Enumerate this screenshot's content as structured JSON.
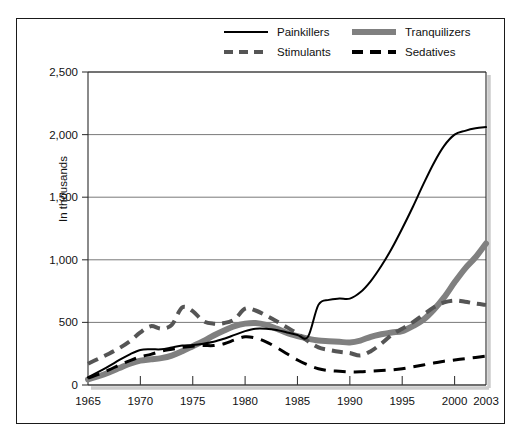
{
  "chart_data": {
    "type": "line",
    "title": "",
    "xlabel": "",
    "ylabel": "In thousands",
    "xlim": [
      1965,
      2003
    ],
    "ylim": [
      0,
      2500
    ],
    "grid": true,
    "legend_position": "top",
    "x_ticks": [
      "1965",
      "1970",
      "1975",
      "1980",
      "1985",
      "1990",
      "1995",
      "2000",
      "2003"
    ],
    "x_tick_values": [
      1965,
      1970,
      1975,
      1980,
      1985,
      1990,
      1995,
      2000,
      2003
    ],
    "y_ticks": [
      "0",
      "500",
      "1,000",
      "1,500",
      "2,000",
      "2,500"
    ],
    "y_tick_values": [
      0,
      500,
      1000,
      1500,
      2000,
      2500
    ],
    "x": [
      1965,
      1966,
      1967,
      1968,
      1969,
      1970,
      1971,
      1972,
      1973,
      1974,
      1975,
      1976,
      1977,
      1978,
      1979,
      1980,
      1981,
      1982,
      1983,
      1984,
      1985,
      1986,
      1987,
      1988,
      1989,
      1990,
      1991,
      1992,
      1993,
      1994,
      1995,
      1996,
      1997,
      1998,
      1999,
      2000,
      2001,
      2002,
      2003
    ],
    "series": [
      {
        "name": "Painkillers",
        "style": "solid",
        "color": "#000000",
        "width": 2,
        "values": [
          60,
          105,
          150,
          200,
          245,
          280,
          285,
          285,
          300,
          315,
          320,
          330,
          345,
          370,
          400,
          430,
          450,
          450,
          440,
          420,
          400,
          385,
          640,
          680,
          690,
          690,
          740,
          830,
          950,
          1090,
          1250,
          1420,
          1600,
          1770,
          1910,
          2000,
          2030,
          2050,
          2060
        ]
      },
      {
        "name": "Tranquilizers",
        "style": "solid",
        "color": "#808080",
        "width": 6,
        "values": [
          45,
          70,
          100,
          135,
          170,
          195,
          205,
          215,
          235,
          270,
          310,
          350,
          395,
          435,
          470,
          490,
          495,
          480,
          450,
          415,
          390,
          370,
          355,
          350,
          345,
          340,
          355,
          385,
          405,
          420,
          430,
          470,
          520,
          600,
          700,
          820,
          930,
          1020,
          1130
        ]
      },
      {
        "name": "Stimulants",
        "style": "dashed",
        "color": "#555555",
        "width": 4,
        "values": [
          170,
          210,
          250,
          295,
          350,
          420,
          470,
          450,
          480,
          620,
          590,
          510,
          490,
          495,
          525,
          610,
          595,
          555,
          510,
          460,
          410,
          350,
          300,
          280,
          265,
          255,
          235,
          270,
          330,
          400,
          450,
          500,
          560,
          620,
          660,
          675,
          665,
          650,
          640
        ]
      },
      {
        "name": "Sedatives",
        "style": "dashed",
        "color": "#000000",
        "width": 3,
        "values": [
          55,
          85,
          120,
          160,
          195,
          225,
          245,
          270,
          285,
          300,
          310,
          315,
          315,
          330,
          360,
          385,
          375,
          345,
          300,
          250,
          200,
          160,
          130,
          115,
          110,
          105,
          105,
          110,
          115,
          120,
          130,
          145,
          160,
          175,
          190,
          200,
          210,
          220,
          230
        ]
      }
    ]
  },
  "legend": {
    "items": [
      {
        "label": "Painkillers",
        "swatch": "solid-black-line-icon"
      },
      {
        "label": "Tranquilizers",
        "swatch": "thick-gray-line-icon"
      },
      {
        "label": "Stimulants",
        "swatch": "dashed-gray-line-icon"
      },
      {
        "label": "Sedatives",
        "swatch": "dashed-black-line-icon"
      }
    ]
  },
  "axes": {
    "y_label": "In thousands"
  }
}
